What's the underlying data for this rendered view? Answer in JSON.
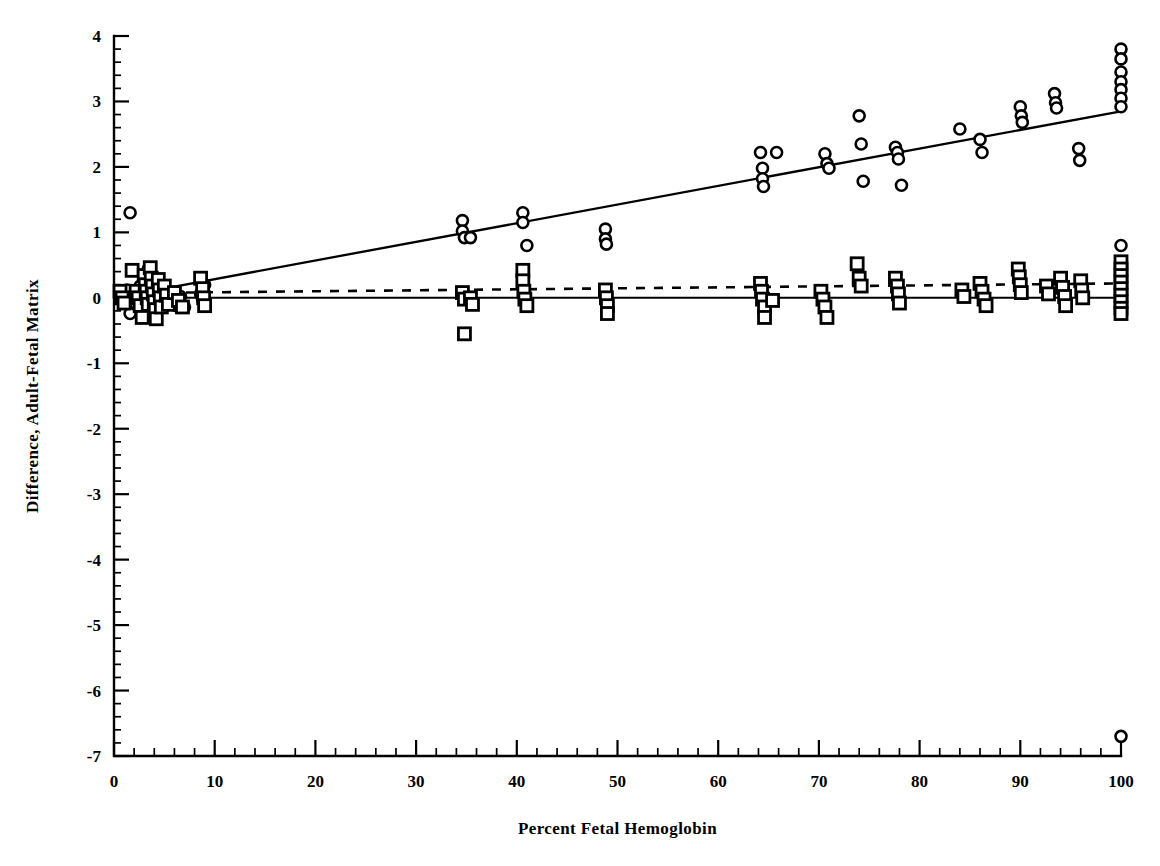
{
  "figure": {
    "background": "#ffffff",
    "ink_color": "#000000"
  },
  "chart_data": {
    "type": "scatter",
    "title": "",
    "subtitle": "",
    "xlabel": "Percent Fetal Hemoglobin",
    "ylabel": "Difference, Adult-Fetal Matrix",
    "xlim": [
      0,
      100
    ],
    "ylim": [
      -7,
      4
    ],
    "xticks": [
      0,
      10,
      20,
      30,
      40,
      50,
      60,
      70,
      80,
      90,
      100
    ],
    "xticklabels": [
      "0",
      "10",
      "20",
      "30",
      "40",
      "50",
      "60",
      "70",
      "80",
      "90",
      "100"
    ],
    "x_minor_tick_step": 2,
    "yticks": [
      -7,
      -6,
      -5,
      -4,
      -3,
      -2,
      -1,
      0,
      1,
      2,
      3,
      4
    ],
    "yticklabels": [
      "-7",
      "-6",
      "-5",
      "-4",
      "-3",
      "-2",
      "-1",
      "0",
      "1",
      "2",
      "3",
      "4"
    ],
    "y_minor_tick_step": 0.2,
    "grid": false,
    "legend": null,
    "annotations": [],
    "series": [
      {
        "name": "circle-series",
        "marker": "open-circle",
        "marker_size": 11,
        "fit_line": {
          "style": "solid",
          "x": [
            0,
            100
          ],
          "y": [
            0.0,
            2.85
          ]
        },
        "points": [
          [
            1.6,
            1.3
          ],
          [
            1.3,
            0.12
          ],
          [
            1.5,
            -0.05
          ],
          [
            1.6,
            -0.24
          ],
          [
            2.0,
            0.05
          ],
          [
            2.2,
            -0.1
          ],
          [
            2.6,
            0.18
          ],
          [
            2.8,
            0.0
          ],
          [
            3.0,
            0.32
          ],
          [
            3.1,
            0.12
          ],
          [
            3.2,
            -0.06
          ],
          [
            3.4,
            0.44
          ],
          [
            3.5,
            0.22
          ],
          [
            3.6,
            0.05
          ],
          [
            3.7,
            -0.12
          ],
          [
            3.8,
            0.3
          ],
          [
            4.0,
            0.16
          ],
          [
            4.1,
            0.0
          ],
          [
            4.2,
            -0.18
          ],
          [
            4.4,
            0.26
          ],
          [
            4.6,
            0.08
          ],
          [
            4.8,
            -0.08
          ],
          [
            5.2,
            0.1
          ],
          [
            5.6,
            -0.02
          ],
          [
            6.2,
            -0.12
          ],
          [
            6.6,
            0.02
          ],
          [
            7.0,
            -0.14
          ],
          [
            8.6,
            0.06
          ],
          [
            8.8,
            -0.02
          ],
          [
            9.0,
            0.2
          ],
          [
            34.6,
            1.18
          ],
          [
            34.6,
            1.02
          ],
          [
            34.8,
            0.92
          ],
          [
            35.4,
            0.92
          ],
          [
            40.6,
            1.3
          ],
          [
            40.6,
            1.15
          ],
          [
            41.0,
            0.8
          ],
          [
            48.8,
            1.05
          ],
          [
            48.8,
            0.9
          ],
          [
            48.9,
            0.82
          ],
          [
            64.2,
            2.22
          ],
          [
            64.4,
            1.98
          ],
          [
            64.4,
            1.82
          ],
          [
            64.5,
            1.7
          ],
          [
            65.8,
            2.22
          ],
          [
            70.6,
            2.2
          ],
          [
            70.8,
            2.05
          ],
          [
            71.0,
            1.98
          ],
          [
            74.0,
            2.78
          ],
          [
            74.2,
            2.35
          ],
          [
            74.4,
            1.78
          ],
          [
            77.6,
            2.3
          ],
          [
            77.8,
            2.22
          ],
          [
            77.9,
            2.12
          ],
          [
            78.2,
            1.72
          ],
          [
            84.0,
            2.58
          ],
          [
            86.0,
            2.42
          ],
          [
            86.2,
            2.22
          ],
          [
            90.0,
            2.92
          ],
          [
            90.1,
            2.78
          ],
          [
            90.2,
            2.68
          ],
          [
            93.4,
            3.12
          ],
          [
            93.5,
            2.98
          ],
          [
            93.6,
            2.9
          ],
          [
            95.8,
            2.28
          ],
          [
            95.9,
            2.1
          ],
          [
            100.0,
            3.8
          ],
          [
            100.0,
            3.65
          ],
          [
            100.0,
            3.45
          ],
          [
            100.0,
            3.3
          ],
          [
            100.0,
            3.18
          ],
          [
            100.0,
            3.05
          ],
          [
            100.0,
            2.92
          ],
          [
            100.0,
            0.8
          ],
          [
            100.0,
            -6.7
          ]
        ]
      },
      {
        "name": "square-series",
        "marker": "open-square",
        "marker_size": 12,
        "fit_line": {
          "style": "dashed",
          "x": [
            0,
            100
          ],
          "y": [
            0.07,
            0.22
          ]
        },
        "points": [
          [
            0.6,
            0.1
          ],
          [
            0.8,
            0.0
          ],
          [
            1.0,
            -0.08
          ],
          [
            1.8,
            0.42
          ],
          [
            2.2,
            0.1
          ],
          [
            2.4,
            0.0
          ],
          [
            2.6,
            -0.12
          ],
          [
            2.8,
            -0.3
          ],
          [
            3.0,
            0.34
          ],
          [
            3.1,
            0.2
          ],
          [
            3.2,
            0.1
          ],
          [
            3.3,
            0.0
          ],
          [
            3.4,
            -0.1
          ],
          [
            3.6,
            0.46
          ],
          [
            3.7,
            0.3
          ],
          [
            3.8,
            0.18
          ],
          [
            3.9,
            0.06
          ],
          [
            4.0,
            -0.06
          ],
          [
            4.1,
            -0.18
          ],
          [
            4.2,
            -0.32
          ],
          [
            4.4,
            0.28
          ],
          [
            4.5,
            0.12
          ],
          [
            4.6,
            0.0
          ],
          [
            4.7,
            -0.14
          ],
          [
            5.0,
            0.18
          ],
          [
            5.2,
            0.04
          ],
          [
            5.4,
            -0.1
          ],
          [
            6.0,
            0.08
          ],
          [
            6.4,
            -0.04
          ],
          [
            6.8,
            -0.14
          ],
          [
            8.6,
            0.3
          ],
          [
            8.8,
            0.14
          ],
          [
            8.9,
            0.0
          ],
          [
            9.0,
            -0.12
          ],
          [
            34.6,
            0.08
          ],
          [
            34.8,
            -0.02
          ],
          [
            35.4,
            0.0
          ],
          [
            35.6,
            -0.1
          ],
          [
            34.8,
            -0.55
          ],
          [
            40.6,
            0.42
          ],
          [
            40.6,
            0.26
          ],
          [
            40.7,
            0.1
          ],
          [
            40.8,
            -0.02
          ],
          [
            41.0,
            -0.12
          ],
          [
            48.8,
            0.12
          ],
          [
            48.9,
            0.0
          ],
          [
            49.0,
            -0.12
          ],
          [
            49.0,
            -0.24
          ],
          [
            64.2,
            0.22
          ],
          [
            64.3,
            0.1
          ],
          [
            64.4,
            -0.02
          ],
          [
            64.6,
            -0.14
          ],
          [
            64.6,
            -0.3
          ],
          [
            65.4,
            -0.04
          ],
          [
            70.2,
            0.1
          ],
          [
            70.4,
            -0.02
          ],
          [
            70.6,
            -0.14
          ],
          [
            70.8,
            -0.3
          ],
          [
            73.8,
            0.52
          ],
          [
            74.0,
            0.3
          ],
          [
            74.2,
            0.18
          ],
          [
            77.6,
            0.3
          ],
          [
            77.8,
            0.18
          ],
          [
            77.9,
            0.06
          ],
          [
            78.0,
            -0.08
          ],
          [
            84.2,
            0.12
          ],
          [
            84.4,
            0.02
          ],
          [
            86.0,
            0.22
          ],
          [
            86.2,
            0.1
          ],
          [
            86.4,
            -0.02
          ],
          [
            86.6,
            -0.12
          ],
          [
            89.8,
            0.44
          ],
          [
            89.9,
            0.32
          ],
          [
            90.0,
            0.2
          ],
          [
            90.1,
            0.08
          ],
          [
            92.6,
            0.18
          ],
          [
            92.8,
            0.06
          ],
          [
            94.0,
            0.3
          ],
          [
            94.2,
            0.16
          ],
          [
            94.4,
            0.02
          ],
          [
            94.5,
            -0.12
          ],
          [
            96.0,
            0.26
          ],
          [
            96.1,
            0.12
          ],
          [
            96.2,
            0.0
          ],
          [
            100.0,
            0.55
          ],
          [
            100.0,
            0.44
          ],
          [
            100.0,
            0.34
          ],
          [
            100.0,
            0.24
          ],
          [
            100.0,
            0.14
          ],
          [
            100.0,
            0.04
          ],
          [
            100.0,
            -0.06
          ],
          [
            100.0,
            -0.16
          ],
          [
            100.0,
            -0.24
          ]
        ]
      }
    ]
  }
}
